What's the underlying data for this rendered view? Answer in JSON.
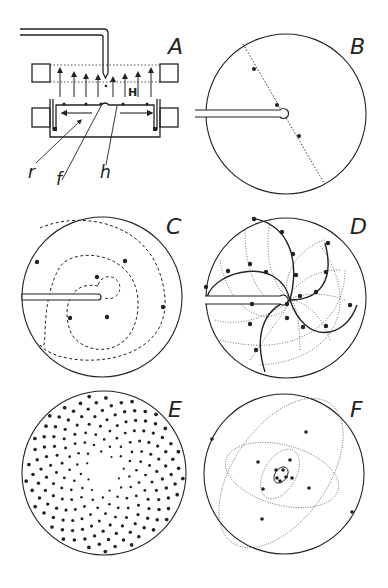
{
  "figure": {
    "panels": [
      {
        "id": "A",
        "label": "A",
        "description": "Apparatus: capillary tube dropping particles into dish between magnet poles, field H upward"
      },
      {
        "id": "B",
        "label": "B",
        "description": "Three drops aligned along a diameter"
      },
      {
        "id": "C",
        "label": "C",
        "description": "Drops on a single spiral"
      },
      {
        "id": "D",
        "label": "D",
        "description": "Drops on multiple crossing spirals (parastichies)"
      },
      {
        "id": "E",
        "label": "E",
        "description": "Many drops forming phyllotactic pattern"
      },
      {
        "id": "F",
        "label": "F",
        "description": "Drops with nested ellipses"
      }
    ],
    "panel_a_labels": {
      "field": "H",
      "r": "r",
      "f": "f",
      "h": "h"
    }
  },
  "colors": {
    "ink": "#222222",
    "background": "#ffffff"
  }
}
